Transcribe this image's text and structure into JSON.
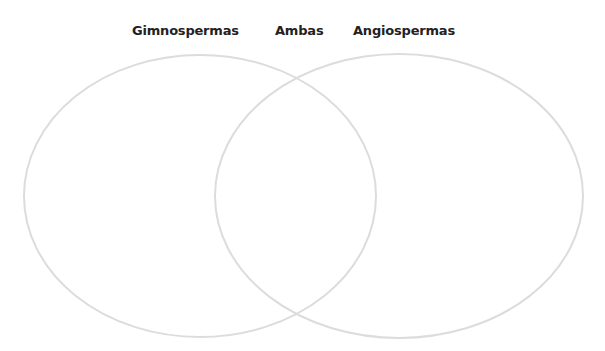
{
  "diagram": {
    "type": "venn",
    "labels": {
      "left": "Gimnospermas",
      "middle": "Ambas",
      "right": "Angiospermas"
    },
    "circles": [
      {
        "name": "gimnospermas",
        "cx": 200,
        "cy": 196,
        "rx": 176,
        "ry": 141
      },
      {
        "name": "angiospermas",
        "cx": 399,
        "cy": 196,
        "rx": 184,
        "ry": 142
      }
    ],
    "stroke_color": "#dcdcdc"
  }
}
